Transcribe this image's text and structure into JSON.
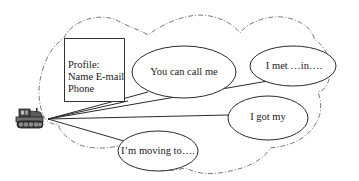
{
  "diagram": {
    "type": "mind-map",
    "boundary": {
      "shape": "cloud",
      "stroke": "dash-dot",
      "color": "#555555"
    },
    "center_node": {
      "icon": "tractor-icon",
      "x": 48,
      "y": 119
    },
    "profile": {
      "title": "Profile:",
      "line1": "Name E-mail",
      "line2": "Phone"
    },
    "bubbles": [
      {
        "id": "call-me",
        "label": "You can call me",
        "cx": 184,
        "cy": 72,
        "rx": 52,
        "ry": 26
      },
      {
        "id": "met-in",
        "label": "I met …in….",
        "cx": 293,
        "cy": 66,
        "rx": 43,
        "ry": 20
      },
      {
        "id": "got-my",
        "label": "I got my",
        "cx": 268,
        "cy": 118,
        "rx": 40,
        "ry": 22
      },
      {
        "id": "moving-to",
        "label": "I’m moving to….",
        "cx": 158,
        "cy": 151,
        "rx": 40,
        "ry": 20
      }
    ],
    "colors": {
      "stroke": "#2b2b2b",
      "background": "#ffffff"
    }
  }
}
